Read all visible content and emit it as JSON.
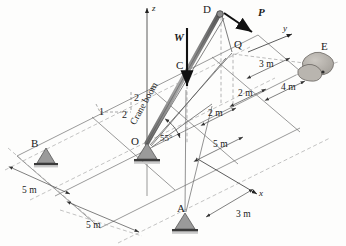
{
  "figure": {
    "type": "engineering-statics-diagram"
  },
  "axes": {
    "z": "z",
    "y": "y",
    "x": "x"
  },
  "points": {
    "A": "A",
    "B": "B",
    "C": "C",
    "D": "D",
    "E": "E",
    "O": "O",
    "Q": "Q"
  },
  "forces": {
    "W": "W",
    "P": "P"
  },
  "labels": {
    "boom": "Crane boom",
    "angle": "55°"
  },
  "slope_triangle": {
    "rise": "2",
    "run_left": "1",
    "run_right": "2"
  },
  "dimensions": {
    "d_3m_right": "3 m",
    "d_4m": "4 m",
    "d_2m_upper": "2 m",
    "d_2m_lower": "2 m",
    "d_5m_right": "5 m",
    "d_5m_left_upper": "5 m",
    "d_5m_left_lower": "5 m",
    "d_3m_bottom": "3 m"
  },
  "colors": {
    "line": "#4a4a4a",
    "dashed": "#8a8a8a",
    "boom": "#7d7d7d",
    "support": "#9a9a9a",
    "support_dark": "#3a3a3a",
    "blob": "#b4b0ab",
    "arrow": "#111111",
    "background": "#fdfdfc"
  }
}
